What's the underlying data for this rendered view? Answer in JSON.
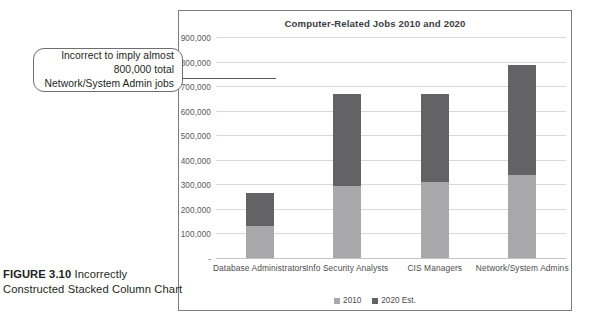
{
  "figure": {
    "label": "FIGURE 3.10",
    "caption": " Incorrectly Constructed Stacked Column Chart"
  },
  "callout": {
    "text": "Incorrect to imply almost 800,000 total Network/System Admin jobs"
  },
  "colors": {
    "series_2010": "#a8a8ab",
    "series_2020": "#636366",
    "frame": "#7c7c80",
    "gridline": "#d9d9dc",
    "text": "#4c4c4f"
  },
  "chart_data": {
    "type": "bar",
    "subtype": "stacked-column",
    "title": "Computer-Related Jobs 2010 and 2020",
    "xlabel": "",
    "ylabel": "",
    "categories": [
      "Database Administrators",
      "Info Security Analysts",
      "CIS Managers",
      "Network/System Admins"
    ],
    "series": [
      {
        "name": "2010",
        "values": [
          131000,
          292000,
          310000,
          339000
        ]
      },
      {
        "name": "2020 Est.",
        "values": [
          132000,
          378000,
          360000,
          449000
        ]
      }
    ],
    "stack_totals": [
      263000,
      670000,
      670000,
      788000
    ],
    "ylim": [
      0,
      900000
    ],
    "ytick_values": [
      0,
      100000,
      200000,
      300000,
      400000,
      500000,
      600000,
      700000,
      800000,
      900000
    ],
    "ytick_labels": [
      "-",
      "100,000",
      "200,000",
      "300,000",
      "400,000",
      "500,000",
      "600,000",
      "700,000",
      "800,000",
      "900,000"
    ],
    "grid": true,
    "legend_position": "bottom",
    "legend_entries": [
      "2010",
      "2020 Est."
    ]
  }
}
